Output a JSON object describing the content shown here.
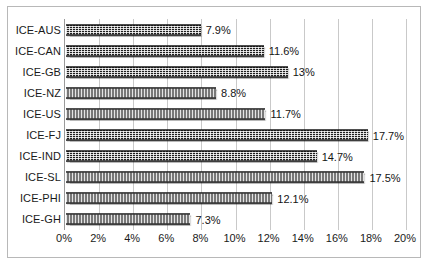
{
  "chart_data": {
    "type": "bar",
    "orientation": "horizontal",
    "title": "",
    "xlabel": "",
    "ylabel": "",
    "xlim": [
      0,
      20
    ],
    "grid": true,
    "legend": false,
    "categories": [
      "ICE-AUS",
      "ICE-CAN",
      "ICE-GB",
      "ICE-NZ",
      "ICE-US",
      "ICE-FJ",
      "ICE-IND",
      "ICE-SL",
      "ICE-PHI",
      "ICE-GH"
    ],
    "values": [
      7.9,
      11.6,
      13,
      8.8,
      11.7,
      17.7,
      14.7,
      17.5,
      12.1,
      7.3
    ],
    "data_labels": [
      "7.9%",
      "11.6%",
      "13%",
      "8.8%",
      "11.7%",
      "17.7%",
      "14.7%",
      "17.5%",
      "12.1%",
      "7.3%"
    ],
    "xticks": [
      0,
      2,
      4,
      6,
      8,
      10,
      12,
      14,
      16,
      18,
      20
    ],
    "xtick_labels": [
      "0%",
      "2%",
      "4%",
      "6%",
      "8%",
      "10%",
      "12%",
      "14%",
      "16%",
      "18%",
      "20%"
    ],
    "colors": {
      "bar_fill": "#1e1e1e",
      "gridline": "#c9c9c9",
      "axis": "#9a9a9a",
      "frame": "#b8b8b8",
      "background": "#ffffff",
      "text": "#1a1a1a"
    }
  }
}
